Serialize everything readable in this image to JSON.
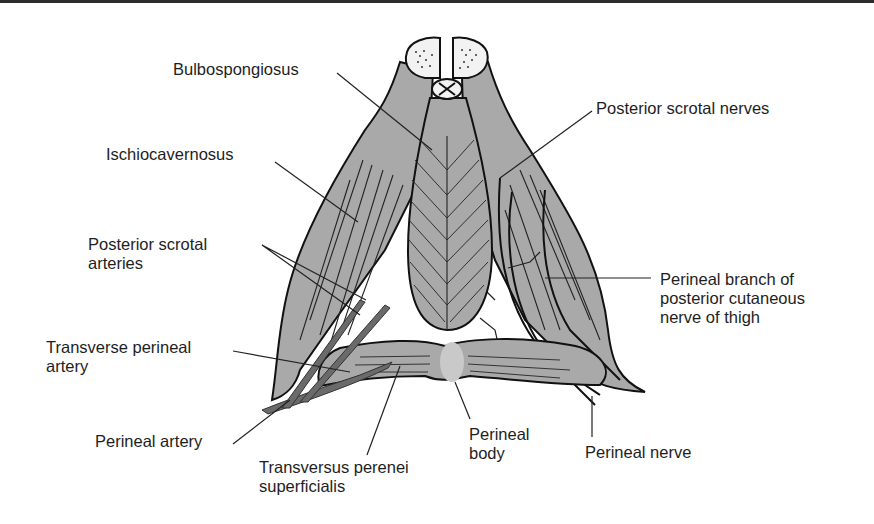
{
  "colors": {
    "muscle": "#a9a9a9",
    "muscle_outline": "#111111",
    "artery": "#6a6a6a",
    "perineal_body": "#c9c9c9",
    "crura_fill": "#f2f2f2",
    "background": "#ffffff",
    "text": "#1e1e1e"
  },
  "labels": {
    "bulbospongiosus": "Bulbospongiosus",
    "ischiocavernosus": "Ischiocavernosus",
    "posterior_scrotal_arteries": [
      "Posterior scrotal",
      "arteries"
    ],
    "transverse_perineal_artery": [
      "Transverse perineal",
      "artery"
    ],
    "perineal_artery": "Perineal artery",
    "transversus_perenei_superficialis": [
      "Transversus perenei",
      "superficialis"
    ],
    "perineal_body": [
      "Perineal",
      "body"
    ],
    "perineal_nerve": "Perineal nerve",
    "posterior_scrotal_nerves": "Posterior scrotal nerves",
    "perineal_branch": [
      "Perineal branch of",
      "posterior cutaneous",
      "nerve of thigh"
    ]
  },
  "icons": {
    "penile_crura": "cross-section-circles",
    "urethra": "small-circle-with-x"
  }
}
